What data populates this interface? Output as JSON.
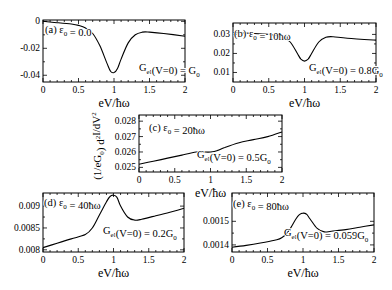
{
  "chart_data": [
    {
      "type": "line",
      "panel": "a",
      "annotation": "(a) ε0 = 0.0",
      "label": "Gel(V=0) = G0",
      "xlabel": "eV/ħω",
      "xlim": [
        0,
        2
      ],
      "ylim": [
        -0.045,
        0.001
      ],
      "xticks": [
        0,
        0.5,
        1,
        1.5,
        2
      ],
      "yticks": [
        0,
        -0.02,
        -0.04
      ],
      "ytick_labels": [
        "0",
        "-0.02",
        "-0.04"
      ],
      "frame": [
        43,
        20,
        185,
        82
      ],
      "x": [
        0,
        0.2,
        0.4,
        0.5,
        0.6,
        0.7,
        0.8,
        0.9,
        0.95,
        1.0,
        1.05,
        1.1,
        1.2,
        1.3,
        1.4,
        1.5,
        1.7,
        2.0
      ],
      "y": [
        0,
        -0.001,
        -0.002,
        -0.003,
        -0.005,
        -0.009,
        -0.018,
        -0.031,
        -0.037,
        -0.038,
        -0.035,
        -0.028,
        -0.016,
        -0.01,
        -0.008,
        -0.008,
        -0.009,
        -0.011
      ]
    },
    {
      "type": "line",
      "panel": "b",
      "annotation": "(b) ε0 = 10ħω",
      "label": "Gel(V=0) = 0.8G0",
      "xlabel": "eV/ħω",
      "xlim": [
        0,
        2
      ],
      "ylim": [
        0.005,
        0.036
      ],
      "xticks": [
        0,
        0.5,
        1,
        1.5,
        2
      ],
      "yticks": [
        0.03,
        0.02,
        0.01
      ],
      "ytick_labels": [
        "0.03",
        "0.02",
        "0.01"
      ],
      "frame": [
        233,
        23,
        376,
        82
      ],
      "x": [
        0,
        0.3,
        0.5,
        0.6,
        0.7,
        0.8,
        0.9,
        0.95,
        1.0,
        1.05,
        1.1,
        1.2,
        1.3,
        1.4,
        1.6,
        2.0
      ],
      "y": [
        0.031,
        0.0305,
        0.03,
        0.0295,
        0.0285,
        0.026,
        0.02,
        0.017,
        0.016,
        0.017,
        0.02,
        0.026,
        0.0285,
        0.0288,
        0.028,
        0.027
      ]
    },
    {
      "type": "line",
      "panel": "c",
      "annotation": "(c) ε0 = 20ħω",
      "label": "Gel(V=0) = 0.5G0",
      "xlabel": "eV/ħω",
      "ylabel": "(1/eG0) d²I/dV²",
      "xlim": [
        0,
        2
      ],
      "ylim": [
        0.0247,
        0.0284
      ],
      "xticks": [
        0,
        0.5,
        1,
        1.5,
        2
      ],
      "yticks": [
        0.028,
        0.027,
        0.026,
        0.025
      ],
      "ytick_labels": [
        "0.028",
        "0.027",
        "0.026",
        "0.025"
      ],
      "frame": [
        139,
        115,
        282,
        172
      ],
      "x": [
        0,
        0.2,
        0.4,
        0.6,
        0.8,
        0.9,
        1.0,
        1.1,
        1.2,
        1.4,
        1.6,
        1.8,
        2.0
      ],
      "y": [
        0.0252,
        0.0254,
        0.0256,
        0.0258,
        0.026,
        0.026,
        0.026,
        0.0261,
        0.0263,
        0.0266,
        0.0268,
        0.027,
        0.0273
      ]
    },
    {
      "type": "line",
      "panel": "d",
      "annotation": "(d) ε0 = 40ħω",
      "label": "Gel(V=0) = 0.2G0",
      "xlabel": "eV/ħω",
      "xlim": [
        0,
        2
      ],
      "ylim": [
        0.00795,
        0.0093
      ],
      "xticks": [
        0,
        0.5,
        1,
        1.5,
        2
      ],
      "yticks": [
        0.009,
        0.0085,
        0.008
      ],
      "ytick_labels": [
        "0.009",
        "0.0085",
        "0.008"
      ],
      "frame": [
        43,
        193,
        184,
        252
      ],
      "x": [
        0,
        0.2,
        0.4,
        0.6,
        0.7,
        0.8,
        0.9,
        0.95,
        1.0,
        1.05,
        1.1,
        1.2,
        1.3,
        1.4,
        1.6,
        1.8,
        2.0
      ],
      "y": [
        0.00805,
        0.00815,
        0.00825,
        0.00835,
        0.0085,
        0.0088,
        0.0091,
        0.00922,
        0.00925,
        0.0092,
        0.009,
        0.00875,
        0.00868,
        0.0087,
        0.00878,
        0.00886,
        0.00895
      ]
    },
    {
      "type": "line",
      "panel": "e",
      "annotation": "(e) ε0 = 80ħω",
      "label": "Gel(V=0) = 0.059G0",
      "xlabel": "eV/ħω",
      "xlim": [
        0,
        2
      ],
      "ylim": [
        0.00137,
        0.00162
      ],
      "xticks": [
        0,
        0.5,
        1,
        1.5,
        2
      ],
      "yticks": [
        0.0015,
        0.0014
      ],
      "ytick_labels": [
        "0.0015",
        "0.0014"
      ],
      "frame": [
        232,
        193,
        374,
        252
      ],
      "x": [
        0,
        0.2,
        0.4,
        0.6,
        0.7,
        0.8,
        0.9,
        0.95,
        1.0,
        1.05,
        1.1,
        1.2,
        1.3,
        1.4,
        1.6,
        1.8,
        2.0
      ],
      "y": [
        0.00139,
        0.001398,
        0.001408,
        0.00142,
        0.00143,
        0.00146,
        0.00151,
        0.001528,
        0.001535,
        0.00153,
        0.00151,
        0.00147,
        0.001455,
        0.001458,
        0.001465,
        0.001475,
        0.001485
      ]
    }
  ],
  "labels": {
    "xlabel": "eV/ħω",
    "ylabel": "(1/eG0) d²I/dV²",
    "xtick_labels": [
      "0",
      "0.5",
      "1",
      "1.5",
      "2"
    ]
  }
}
